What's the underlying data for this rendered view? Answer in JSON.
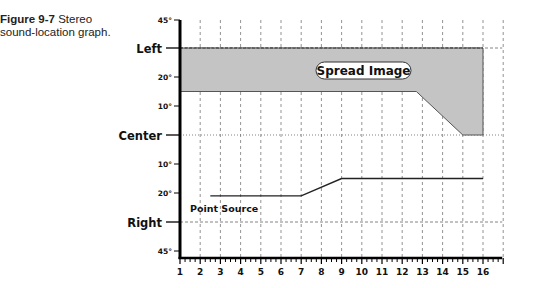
{
  "caption": {
    "figure_number": "Figure 9-7",
    "title_part1": "Stereo",
    "title_part2": "sound-location graph."
  },
  "chart_data": {
    "type": "area",
    "title": "Stereo sound-location graph",
    "xlabel": "",
    "ylabel": "",
    "x_ticks": [
      "1",
      "2",
      "3",
      "4",
      "5",
      "6",
      "7",
      "8",
      "9",
      "10",
      "11",
      "12",
      "13",
      "14",
      "15",
      "16"
    ],
    "xlim": [
      1,
      17
    ],
    "y_ticks": [
      "45°",
      "Left",
      "20°",
      "10°",
      "Center",
      "10°",
      "20°",
      "Right",
      "45°"
    ],
    "y_tick_values": [
      45,
      30,
      20,
      10,
      0,
      -10,
      -20,
      -30,
      -45
    ],
    "grid": "vertical dashed at each integer; horizontal dashed at Left/Right, dotted at Center",
    "series": [
      {
        "name": "Spread Image",
        "kind": "filled-area",
        "upper": [
          [
            1,
            30
          ],
          [
            16,
            30
          ]
        ],
        "lower": [
          [
            1,
            15
          ],
          [
            12.7,
            15
          ],
          [
            15,
            0
          ],
          [
            16,
            0
          ]
        ]
      },
      {
        "name": "Point Source",
        "kind": "line",
        "points": [
          [
            2.5,
            -21
          ],
          [
            7,
            -21
          ],
          [
            9,
            -15
          ],
          [
            16,
            -15
          ]
        ]
      }
    ],
    "annotations": [
      "Spread Image",
      "Point Source"
    ]
  }
}
